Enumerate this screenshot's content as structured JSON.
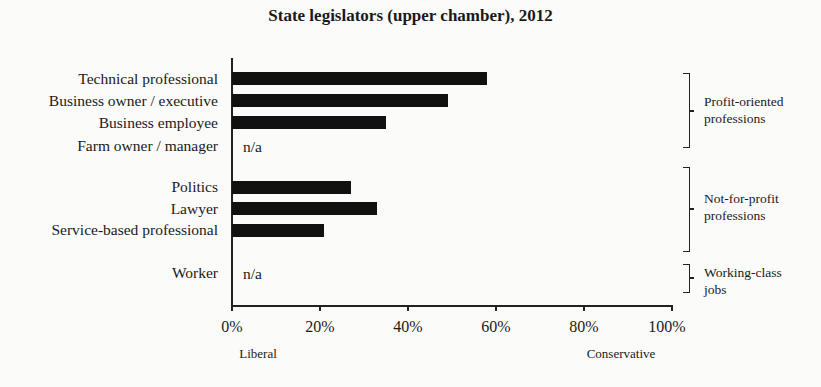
{
  "chart_data": {
    "type": "bar",
    "orientation": "horizontal",
    "title": "State legislators (upper chamber), 2012",
    "categories": [
      "Technical professional",
      "Business owner / executive",
      "Business employee",
      "Farm owner / manager",
      "Politics",
      "Lawyer",
      "Service-based professional",
      "Worker"
    ],
    "values": [
      58,
      49,
      35,
      null,
      27,
      33,
      21,
      null
    ],
    "value_labels": [
      "",
      "",
      "",
      "n/a",
      "",
      "",
      "",
      "n/a"
    ],
    "xlabel": "",
    "ylabel": "",
    "xlim": [
      0,
      100
    ],
    "x_ticks": [
      "0%",
      "20%",
      "40%",
      "60%",
      "80%",
      "100%"
    ],
    "x_end_labels": {
      "left": "Liberal",
      "right": "Conservative"
    },
    "groups": [
      {
        "label_line1": "Profit-oriented",
        "label_line2": "professions",
        "members": [
          "Technical professional",
          "Business owner / executive",
          "Business employee",
          "Farm owner / manager"
        ]
      },
      {
        "label_line1": "Not-for-profit",
        "label_line2": "professions",
        "members": [
          "Politics",
          "Lawyer",
          "Service-based professional"
        ]
      },
      {
        "label_line1": "Working-class",
        "label_line2": "jobs",
        "members": [
          "Worker"
        ]
      }
    ],
    "grid": false,
    "legend": "none",
    "bar_color": "#111111"
  }
}
